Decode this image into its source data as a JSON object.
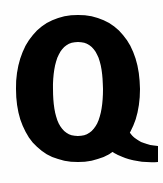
{
  "glyph": {
    "character": "Q",
    "color": "#000000",
    "background": "#ffffff",
    "weight": "black"
  }
}
